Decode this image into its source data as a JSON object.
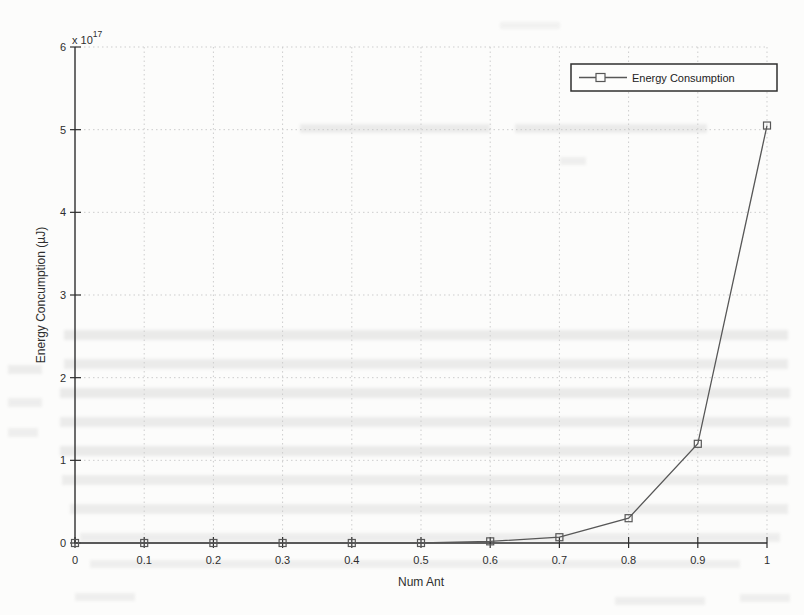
{
  "figure": {
    "background": "#fcfcfb"
  },
  "chart_data": {
    "type": "line",
    "title": "",
    "xlabel": "Num Ant",
    "ylabel": "Energy Concumption (µJ)",
    "y_axis_exponent_label": {
      "prefix": "x 10",
      "exponent": "17"
    },
    "legend": [
      {
        "label": "Energy Consumption",
        "marker": "open-square",
        "line": "solid"
      }
    ],
    "legend_position": "top-right",
    "grid": "on",
    "xlim": [
      0,
      1
    ],
    "ylim": [
      0,
      6
    ],
    "x_ticks": [
      0,
      0.1,
      0.2,
      0.3,
      0.4,
      0.5,
      0.6,
      0.7,
      0.8,
      0.9,
      1
    ],
    "x_tick_labels": [
      "0",
      "0.1",
      "0.2",
      "0.3",
      "0.4",
      "0.5",
      "0.6",
      "0.7",
      "0.8",
      "0.9",
      "1"
    ],
    "y_ticks": [
      0,
      1,
      2,
      3,
      4,
      5,
      6
    ],
    "y_tick_labels": [
      "0",
      "1",
      "2",
      "3",
      "4",
      "5",
      "6"
    ],
    "x": [
      0,
      0.1,
      0.2,
      0.3,
      0.4,
      0.5,
      0.6,
      0.7,
      0.8,
      0.9,
      1
    ],
    "series": [
      {
        "name": "Energy Consumption",
        "values_e17": [
          0,
          0,
          0,
          0,
          0,
          0,
          0.02,
          0.07,
          0.3,
          1.2,
          5.05
        ],
        "units": "µJ, values in multiples of 10^17"
      }
    ],
    "colors": {
      "line": "#575757",
      "axis": "#2f2f2f",
      "grid": "#cdcdcd",
      "text": "#2e2e2e"
    }
  }
}
